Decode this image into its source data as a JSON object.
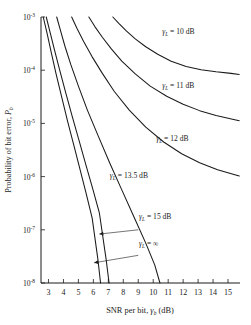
{
  "chart_data": {
    "type": "line",
    "title": "",
    "xlabel": "SNR per bit, γb (dB)",
    "ylabel": "Probability of bit error, Pb",
    "xlabel_parts": {
      "pre": "SNR per bit, ",
      "sym": "γ",
      "sub": "b",
      "post": " (dB)"
    },
    "ylabel_parts": {
      "pre": "Probability of bit error, ",
      "sym": "P",
      "sub": "b"
    },
    "xlim": [
      2.5,
      15.8
    ],
    "ylim_log": [
      -8,
      -3
    ],
    "yscale": "log",
    "grid": false,
    "legend_position": "inline-annotations",
    "xticks": [
      3,
      4,
      5,
      6,
      7,
      8,
      9,
      10,
      11,
      12,
      13,
      14,
      15
    ],
    "xticklabels": [
      "3",
      "4",
      "5",
      "6",
      "7",
      "8",
      "9",
      "10",
      "11",
      "12",
      "13",
      "14",
      "15"
    ],
    "yticks": [
      -3,
      -4,
      -5,
      -6,
      -7,
      -8
    ],
    "yticklabels": [
      "10⁻³",
      "10⁻⁴",
      "10⁻⁵",
      "10⁻⁶",
      "10⁻⁷",
      "10⁻⁸"
    ],
    "ytick_mantissa": "10",
    "ytick_exponents": [
      "-3",
      "-4",
      "-5",
      "-6",
      "-7",
      "-8"
    ],
    "series": [
      {
        "name": "γL = 10 dB",
        "label": "γL = 10 dB",
        "label_parts": {
          "sym": "γ",
          "sub": "L",
          "text": " = 10 dB"
        },
        "label_x": 10.6,
        "label_y_log": -3.32,
        "x": [
          7.3,
          7.7,
          8.2,
          8.8,
          9.5,
          10.3,
          11.2,
          12.2,
          13.2,
          14.2,
          15.2,
          15.75
        ],
        "y_log": [
          -3.0,
          -3.12,
          -3.26,
          -3.41,
          -3.56,
          -3.7,
          -3.83,
          -3.93,
          -3.99,
          -4.03,
          -4.06,
          -4.08
        ]
      },
      {
        "name": "γL = 11 dB",
        "label": "γL = 11 dB",
        "label_parts": {
          "sym": "γ",
          "sub": "L",
          "text": " = 11 dB"
        },
        "label_x": 10.6,
        "label_y_log": -4.33,
        "x": [
          5.7,
          6.1,
          6.6,
          7.2,
          7.9,
          8.8,
          9.8,
          10.9,
          12.0,
          13.1,
          14.2,
          15.3,
          15.75
        ],
        "y_log": [
          -3.0,
          -3.18,
          -3.38,
          -3.6,
          -3.83,
          -4.07,
          -4.3,
          -4.49,
          -4.64,
          -4.76,
          -4.85,
          -4.92,
          -4.95
        ]
      },
      {
        "name": "γL = 12 dB",
        "label": "γL = 12 dB",
        "label_parts": {
          "sym": "γ",
          "sub": "L",
          "text": " = 12 dB"
        },
        "label_x": 10.2,
        "label_y_log": -5.33,
        "x": [
          4.55,
          4.9,
          5.35,
          5.9,
          6.6,
          7.4,
          8.4,
          9.5,
          10.7,
          11.9,
          13.1,
          14.3,
          15.4,
          15.75
        ],
        "y_log": [
          -3.0,
          -3.21,
          -3.46,
          -3.74,
          -4.06,
          -4.4,
          -4.75,
          -5.07,
          -5.35,
          -5.57,
          -5.74,
          -5.87,
          -5.96,
          -5.99
        ]
      },
      {
        "name": "γL = 13.5 dB",
        "label": "γL = 13.5 dB",
        "label_parts": {
          "sym": "γ",
          "sub": "L",
          "text": " = 13.5 dB"
        },
        "label_x": 7.1,
        "label_y_log": -6.02,
        "x": [
          3.55,
          3.8,
          4.1,
          4.5,
          5.0,
          5.6,
          6.3,
          7.1,
          7.9,
          8.7,
          9.5,
          10.1,
          10.45
        ],
        "y_log": [
          -3.0,
          -3.25,
          -3.55,
          -3.9,
          -4.3,
          -4.75,
          -5.22,
          -5.75,
          -6.25,
          -6.75,
          -7.25,
          -7.66,
          -8.0
        ]
      },
      {
        "name": "γL = 15 dB",
        "label": "γL = 15 dB",
        "label_parts": {
          "sym": "γ",
          "sub": "L",
          "text": " = 15 dB"
        },
        "label_x": 9.05,
        "label_y_log": -6.8,
        "arrow_from_x": 9.0,
        "arrow_from_y_log": -7.0,
        "arrow_to_x": 6.4,
        "arrow_to_y_log": -7.08,
        "x": [
          2.85,
          3.1,
          3.4,
          3.75,
          4.15,
          4.6,
          5.05,
          5.5,
          5.95,
          6.4,
          6.85,
          7.05
        ],
        "y_log": [
          -3.0,
          -3.28,
          -3.62,
          -4.0,
          -4.42,
          -4.88,
          -5.33,
          -5.78,
          -6.22,
          -6.68,
          -7.55,
          -8.0
        ]
      },
      {
        "name": "γL = ∞",
        "label": "γL = ∞",
        "label_parts": {
          "sym": "γ",
          "sub": "L",
          "text": " = ∞"
        },
        "label_x": 9.05,
        "label_y_log": -7.3,
        "arrow_from_x": 9.0,
        "arrow_from_y_log": -7.48,
        "arrow_to_x": 6.05,
        "arrow_to_y_log": -7.62,
        "x": [
          2.65,
          2.9,
          3.18,
          3.5,
          3.88,
          4.28,
          4.7,
          5.12,
          5.52,
          5.92,
          6.3,
          6.48
        ],
        "y_log": [
          -3.0,
          -3.3,
          -3.66,
          -4.06,
          -4.5,
          -4.96,
          -5.42,
          -5.88,
          -6.32,
          -6.78,
          -7.55,
          -8.0
        ]
      }
    ]
  },
  "figure": {
    "background_color": "#ffffff",
    "line_color": "#1a1a1a"
  }
}
